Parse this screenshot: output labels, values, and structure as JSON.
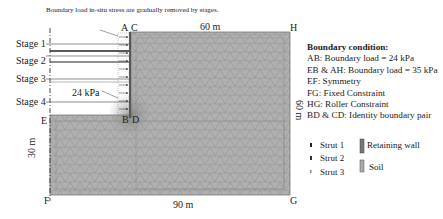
{
  "figure": {
    "annotation": "Boundary load in-situ stress are gradually removed by stages.",
    "stages": [
      "Stage 1",
      "Stage 2",
      "Stage 3",
      "Stage 4"
    ],
    "load_label": "24 kPa",
    "points": {
      "A": "A",
      "B": "B",
      "C": "C",
      "D": "D",
      "E": "E",
      "F": "F",
      "G": "G",
      "H": "H"
    },
    "dimensions": {
      "top": "60 m",
      "bottom": "90 m",
      "left": "30 m",
      "right": "60 m"
    }
  },
  "boundary_condition": {
    "title": "Boundary condition:",
    "lines": [
      "AB: Boundary load = 24 kPa",
      "EB & AH: Boundary load = 35 kPa",
      "EF: Symmetry",
      "FG: Fixed Constraint",
      "HG: Roller Constraint",
      "BD & CD:  Identity boundary pair"
    ]
  },
  "legend": {
    "struts": [
      "Strut 1",
      "Strut 2",
      "Strut 3"
    ],
    "materials": [
      "Retaining wall",
      "Soil"
    ]
  },
  "colors": {
    "mesh_fill": "#a9a9a9",
    "mesh_line": "#8a8a8a",
    "wall": "#555555"
  }
}
